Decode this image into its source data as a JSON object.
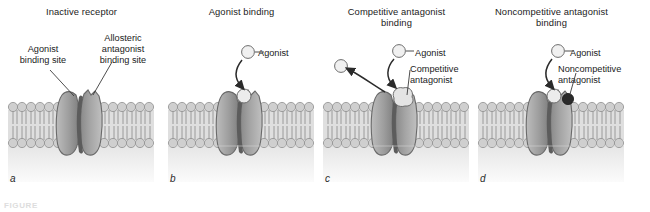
{
  "figure": {
    "caption_partial": "FIGURE",
    "colors": {
      "membrane_head": "#c9c9c9",
      "membrane_tail": "#b5b5b5",
      "receptor_light": "#a8a8a8",
      "receptor_dark": "#6f6f6f",
      "channel": "#5c5c5c",
      "ligand_light": "#e8e8e8",
      "ligand_dark": "#2b2b2b",
      "leader_line": "#3a3a3a",
      "cytosol": "#f2f2f2"
    }
  },
  "panels": [
    {
      "letter": "a",
      "title": "Inactive receptor",
      "labels": {
        "agonist_site": "Agonist\nbinding site",
        "agonist_site_line1": "Agonist",
        "agonist_site_line2": "binding site",
        "allosteric_site_line1": "Allosteric",
        "allosteric_site_line2": "antagonist",
        "allosteric_site_line3": "binding site"
      }
    },
    {
      "letter": "b",
      "title": "Agonist binding",
      "labels": {
        "agonist": "Agonist"
      }
    },
    {
      "letter": "c",
      "title_line1": "Competitive antagonist",
      "title_line2": "binding",
      "labels": {
        "agonist": "Agonist",
        "antagonist_line1": "Competitive",
        "antagonist_line2": "antagonist"
      }
    },
    {
      "letter": "d",
      "title_line1": "Noncompetitive antagonist",
      "title_line2": "binding",
      "labels": {
        "agonist": "Agonist",
        "antagonist_line1": "Noncompetitive",
        "antagonist_line2": "antagonist"
      }
    }
  ]
}
